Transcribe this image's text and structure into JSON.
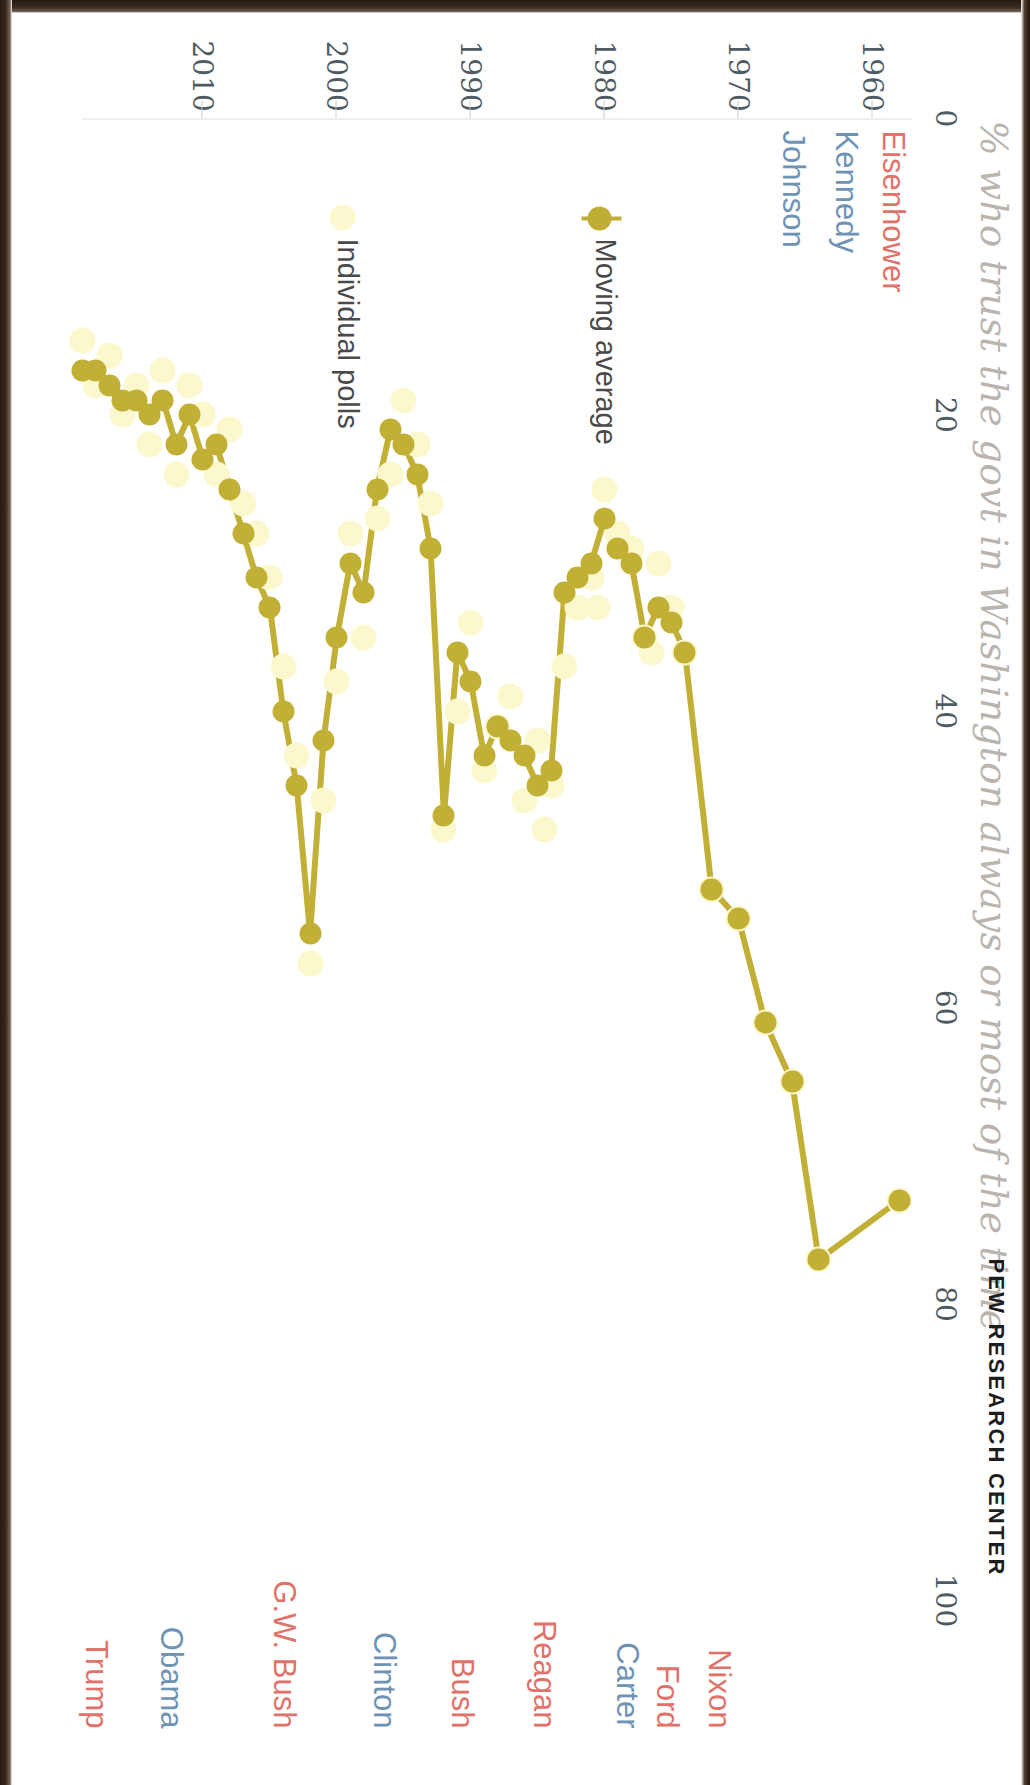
{
  "headline": "% who trust the govt in Washington always or most of the time",
  "brand": "PEW RESEARCH CENTER",
  "legend": {
    "moving_average": "Moving average",
    "individual_polls": "Individual polls"
  },
  "colors": {
    "moving_average": "#c2af36",
    "individual_polls": "#fcf8cd",
    "republican": "#e0726a",
    "democrat": "#6e93b5",
    "axis_text": "#4f5b63",
    "headline": "#b9b4ae"
  },
  "presidents": [
    {
      "name": "Eisenhower",
      "party": "republican",
      "year": 1958.5,
      "side": "left"
    },
    {
      "name": "Kennedy",
      "party": "democrat",
      "year": 1962.0,
      "side": "left"
    },
    {
      "name": "Johnson",
      "party": "democrat",
      "year": 1966.0,
      "side": "left"
    },
    {
      "name": "Nixon",
      "party": "republican",
      "year": 1971.5,
      "side": "right"
    },
    {
      "name": "Ford",
      "party": "republican",
      "year": 1975.4,
      "side": "right"
    },
    {
      "name": "Carter",
      "party": "democrat",
      "year": 1978.4,
      "side": "right"
    },
    {
      "name": "Reagan",
      "party": "republican",
      "year": 1984.6,
      "side": "right"
    },
    {
      "name": "Bush",
      "party": "republican",
      "year": 1990.7,
      "side": "right"
    },
    {
      "name": "Clinton",
      "party": "democrat",
      "year": 1996.5,
      "side": "right"
    },
    {
      "name": "G.W. Bush",
      "party": "republican",
      "year": 2004.0,
      "side": "right"
    },
    {
      "name": "Obama",
      "party": "democrat",
      "year": 2012.4,
      "side": "right"
    },
    {
      "name": "Trump",
      "party": "republican",
      "year": 2018.0,
      "side": "right"
    }
  ],
  "chart_data": {
    "type": "line",
    "title": "% who trust the govt in Washington always or most of the time",
    "subtitle": "",
    "xlabel": "",
    "ylabel": "%",
    "orientation": "vertical-time-axis (page rotated 90 degrees)",
    "grid": false,
    "legend_position": "inside-left",
    "xlim": [
      1957,
      2019
    ],
    "xticks": [
      1960,
      1970,
      1980,
      1990,
      2000,
      2010
    ],
    "xticklabels": [
      "1960",
      "1970",
      "1980",
      "1990",
      "2000",
      "2010"
    ],
    "ylim": [
      0,
      100
    ],
    "yticks": [
      0,
      20,
      40,
      60,
      80,
      100
    ],
    "yticklabels": [
      "0",
      "20",
      "40",
      "60",
      "80",
      "100"
    ],
    "series": [
      {
        "name": "Moving average",
        "color": "#c2af36",
        "marker": "circle",
        "line": true,
        "points": [
          [
            1958.0,
            73
          ],
          [
            1964.0,
            77
          ],
          [
            1966.0,
            65
          ],
          [
            1968.0,
            61
          ],
          [
            1970.0,
            54
          ],
          [
            1972.0,
            52
          ],
          [
            1974.0,
            36
          ],
          [
            1975.0,
            34
          ],
          [
            1976.0,
            33
          ],
          [
            1977.0,
            35
          ],
          [
            1978.0,
            30
          ],
          [
            1979.0,
            29
          ],
          [
            1980.0,
            27
          ],
          [
            1981.0,
            30
          ],
          [
            1982.0,
            31
          ],
          [
            1983.0,
            32
          ],
          [
            1984.0,
            44
          ],
          [
            1985.0,
            45
          ],
          [
            1986.0,
            43
          ],
          [
            1987.0,
            42
          ],
          [
            1988.0,
            41
          ],
          [
            1989.0,
            43
          ],
          [
            1990.0,
            38
          ],
          [
            1991.0,
            36
          ],
          [
            1992.0,
            47
          ],
          [
            1993.0,
            29
          ],
          [
            1994.0,
            24
          ],
          [
            1995.0,
            22
          ],
          [
            1996.0,
            21
          ],
          [
            1997.0,
            25
          ],
          [
            1998.0,
            32
          ],
          [
            1999.0,
            30
          ],
          [
            2000.0,
            35
          ],
          [
            2001.0,
            42
          ],
          [
            2002.0,
            55
          ],
          [
            2003.0,
            45
          ],
          [
            2004.0,
            40
          ],
          [
            2005.0,
            33
          ],
          [
            2006.0,
            31
          ],
          [
            2007.0,
            28
          ],
          [
            2008.0,
            25
          ],
          [
            2009.0,
            22
          ],
          [
            2010.0,
            23
          ],
          [
            2011.0,
            20
          ],
          [
            2012.0,
            22
          ],
          [
            2013.0,
            19
          ],
          [
            2014.0,
            20
          ],
          [
            2015.0,
            19
          ],
          [
            2016.0,
            19
          ],
          [
            2017.0,
            18
          ],
          [
            2018.0,
            17
          ],
          [
            2019.0,
            17
          ]
        ]
      },
      {
        "name": "Individual polls",
        "color": "#fcf8cd",
        "marker": "circle",
        "line": false,
        "points": [
          [
            1958.0,
            73
          ],
          [
            1964.0,
            77
          ],
          [
            1966.0,
            65
          ],
          [
            1968.0,
            61
          ],
          [
            1970.0,
            54
          ],
          [
            1972.0,
            52
          ],
          [
            1974.0,
            36
          ],
          [
            1975.0,
            33
          ],
          [
            1976.0,
            30
          ],
          [
            1976.5,
            36
          ],
          [
            1977.0,
            35
          ],
          [
            1978.0,
            29
          ],
          [
            1979.0,
            28
          ],
          [
            1980.0,
            25
          ],
          [
            1980.5,
            33
          ],
          [
            1981.0,
            31
          ],
          [
            1982.0,
            33
          ],
          [
            1983.0,
            37
          ],
          [
            1984.0,
            45
          ],
          [
            1984.5,
            48
          ],
          [
            1985.0,
            42
          ],
          [
            1986.0,
            46
          ],
          [
            1987.0,
            39
          ],
          [
            1988.0,
            41
          ],
          [
            1989.0,
            44
          ],
          [
            1990.0,
            34
          ],
          [
            1991.0,
            40
          ],
          [
            1992.0,
            48
          ],
          [
            1993.0,
            26
          ],
          [
            1994.0,
            22
          ],
          [
            1995.0,
            19
          ],
          [
            1996.0,
            24
          ],
          [
            1997.0,
            27
          ],
          [
            1998.0,
            35
          ],
          [
            1999.0,
            28
          ],
          [
            2000.0,
            38
          ],
          [
            2001.0,
            46
          ],
          [
            2002.0,
            57
          ],
          [
            2003.0,
            43
          ],
          [
            2004.0,
            37
          ],
          [
            2005.0,
            31
          ],
          [
            2006.0,
            28
          ],
          [
            2007.0,
            26
          ],
          [
            2008.0,
            21
          ],
          [
            2009.0,
            24
          ],
          [
            2010.0,
            20
          ],
          [
            2011.0,
            18
          ],
          [
            2012.0,
            24
          ],
          [
            2013.0,
            17
          ],
          [
            2014.0,
            22
          ],
          [
            2015.0,
            18
          ],
          [
            2016.0,
            20
          ],
          [
            2017.0,
            16
          ],
          [
            2018.0,
            18
          ],
          [
            2019.0,
            15
          ]
        ]
      }
    ]
  }
}
